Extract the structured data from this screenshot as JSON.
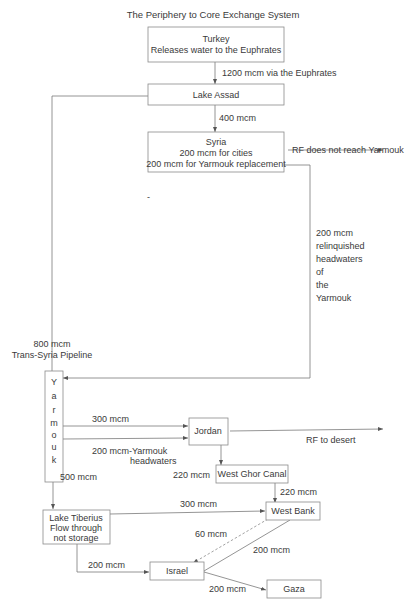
{
  "title": "The Periphery to Core Exchange System",
  "nodes": {
    "turkey": {
      "line1": "Turkey",
      "line2": "Releases water to the Euphrates"
    },
    "lake_assad": {
      "label": "Lake Assad"
    },
    "syria": {
      "line1": "Syria",
      "line2": "200 mcm for cities",
      "line3": "200 mcm for Yarmouk replacement"
    },
    "yarmouk": {
      "letters": [
        "Y",
        "a",
        "r",
        "m",
        "o",
        "u",
        "k"
      ]
    },
    "jordan": {
      "label": "Jordan"
    },
    "west_ghor_canal": {
      "label": "West Ghor Canal"
    },
    "lake_tiberius": {
      "line1": "Lake Tiberius",
      "line2": "Flow through",
      "line3": "not storage"
    },
    "west_bank": {
      "label": "West Bank"
    },
    "israel": {
      "label": "Israel"
    },
    "gaza": {
      "label": "Gaza"
    }
  },
  "flows": {
    "turkey_to_assad": "1200 mcm via the Euphrates",
    "assad_to_syria": "400 mcm",
    "syria_rf": "RF does not reach Yarmouk",
    "syria_to_yarmouk": [
      "200 mcm",
      "relinquished",
      "headwaters",
      "of",
      "the",
      "Yarmouk"
    ],
    "pipeline": {
      "line1": "800 mcm",
      "line2": "Trans-Syria Pipeline"
    },
    "yarmouk_to_jordan_1": "300 mcm",
    "yarmouk_to_jordan_2": {
      "line1": "200 mcm-Yarmouk",
      "line2": "headwaters"
    },
    "jordan_rf": "RF to desert",
    "jordan_to_wgc": "220 mcm",
    "wgc_to_westbank": "220 mcm",
    "yarmouk_to_tiberius": "500 mcm",
    "tiberius_to_westbank": "300 mcm",
    "westbank_to_israel_dashed": "60 mcm",
    "westbank_to_israel": "200 mcm",
    "tiberius_to_israel": "200 mcm",
    "israel_to_gaza": "200 mcm"
  },
  "stray_mark": "-"
}
